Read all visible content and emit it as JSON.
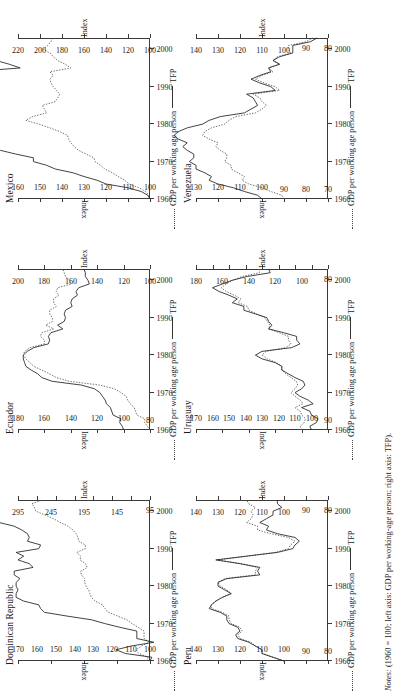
{
  "figure": {
    "notes_label": "Notes:",
    "notes_text": "(1960 = 100; left axis: GDP per working-age person; right axis: TFP).",
    "legend": {
      "gdp_label": "GDP per working age person",
      "tfp_label": "TFP"
    },
    "axis_name": "Index",
    "x_ticks": [
      "1960",
      "1970",
      "1980",
      "1990",
      "2000"
    ]
  },
  "chart_data": [
    {
      "type": "line",
      "title": "Dominican Republic",
      "xlabel": "",
      "ylabel": "Index",
      "y2label": "Index",
      "xlim": [
        1960,
        2003
      ],
      "ylim": [
        95,
        295
      ],
      "y2lim": [
        100,
        170
      ],
      "yticks": [
        95,
        145,
        195,
        245,
        295
      ],
      "y2ticks": [
        100,
        110,
        120,
        130,
        140,
        150,
        160,
        170
      ],
      "xticks": [
        1960,
        1970,
        1980,
        1990,
        2000
      ],
      "grid": false,
      "legend_position": "bottom",
      "x": [
        1960,
        1961,
        1962,
        1963,
        1964,
        1965,
        1966,
        1967,
        1968,
        1969,
        1970,
        1971,
        1972,
        1973,
        1974,
        1975,
        1976,
        1977,
        1978,
        1979,
        1980,
        1981,
        1982,
        1983,
        1984,
        1985,
        1986,
        1987,
        1988,
        1989,
        1990,
        1991,
        1992,
        1993,
        1994,
        1995,
        1996,
        1997,
        1998,
        1999,
        2000,
        2001,
        2002,
        2003
      ],
      "series": [
        {
          "name": "GDP per working age person",
          "style": "dotted",
          "axis": "left",
          "values": [
            100,
            98,
            112,
            116,
            108,
            96,
            104,
            104,
            104,
            113,
            122,
            130,
            144,
            158,
            163,
            167,
            178,
            184,
            186,
            188,
            192,
            194,
            194,
            199,
            200,
            190,
            193,
            201,
            200,
            206,
            193,
            193,
            203,
            204,
            207,
            212,
            219,
            231,
            241,
            254,
            268,
            270,
            274,
            258
          ]
        },
        {
          "name": "TFP",
          "style": "solid",
          "axis": "right",
          "values": [
            100,
            99,
            113,
            118,
            110,
            98,
            107,
            107,
            107,
            116,
            124,
            131,
            144,
            156,
            158,
            159,
            167,
            171,
            171,
            170,
            171,
            171,
            169,
            172,
            172,
            162,
            164,
            170,
            167,
            171,
            159,
            158,
            165,
            164,
            165,
            168,
            172,
            180,
            186,
            194,
            203,
            203,
            204,
            191
          ]
        }
      ]
    },
    {
      "type": "line",
      "title": "Ecuador",
      "xlabel": "",
      "ylabel": "Index",
      "y2label": "Index",
      "xlim": [
        1960,
        2003
      ],
      "ylim": [
        100,
        200
      ],
      "y2lim": [
        80,
        180
      ],
      "yticks": [
        100,
        120,
        140,
        160,
        180,
        200
      ],
      "y2ticks": [
        80,
        100,
        120,
        140,
        160,
        180
      ],
      "xticks": [
        1960,
        1970,
        1980,
        1990,
        2000
      ],
      "grid": false,
      "legend_position": "bottom",
      "x": [
        1960,
        1961,
        1962,
        1963,
        1964,
        1965,
        1966,
        1967,
        1968,
        1969,
        1970,
        1971,
        1972,
        1973,
        1974,
        1975,
        1976,
        1977,
        1978,
        1979,
        1980,
        1981,
        1982,
        1983,
        1984,
        1985,
        1986,
        1987,
        1988,
        1989,
        1990,
        1991,
        1992,
        1993,
        1994,
        1995,
        1996,
        1997,
        1998,
        1999,
        2000,
        2001,
        2002,
        2003
      ],
      "series": [
        {
          "name": "GDP per working age person",
          "style": "dotted",
          "axis": "left",
          "values": [
            100,
            102,
            104,
            104,
            110,
            111,
            112,
            115,
            117,
            118,
            122,
            127,
            138,
            161,
            171,
            176,
            182,
            188,
            191,
            194,
            196,
            195,
            191,
            180,
            180,
            183,
            182,
            173,
            179,
            174,
            174,
            176,
            176,
            171,
            173,
            173,
            169,
            171,
            170,
            160,
            161,
            164,
            165,
            166
          ]
        },
        {
          "name": "TFP",
          "style": "solid",
          "axis": "right",
          "values": [
            100,
            101,
            103,
            102,
            108,
            109,
            110,
            113,
            114,
            116,
            118,
            122,
            132,
            154,
            162,
            165,
            170,
            174,
            175,
            176,
            176,
            173,
            168,
            157,
            156,
            157,
            155,
            146,
            150,
            145,
            144,
            145,
            144,
            139,
            140,
            139,
            135,
            136,
            134,
            126,
            127,
            129,
            129,
            130
          ]
        }
      ]
    },
    {
      "type": "line",
      "title": "Mexico",
      "xlabel": "",
      "ylabel": "Index",
      "y2label": "Index",
      "xlim": [
        1960,
        2003
      ],
      "ylim": [
        100,
        220
      ],
      "y2lim": [
        100,
        160
      ],
      "yticks": [
        100,
        120,
        140,
        160,
        180,
        200,
        220
      ],
      "y2ticks": [
        100,
        110,
        120,
        130,
        140,
        150,
        160
      ],
      "xticks": [
        1960,
        1970,
        1980,
        1990,
        2000
      ],
      "grid": false,
      "legend_position": "bottom",
      "x": [
        1960,
        1961,
        1962,
        1963,
        1964,
        1965,
        1966,
        1967,
        1968,
        1969,
        1970,
        1971,
        1972,
        1973,
        1974,
        1975,
        1976,
        1977,
        1978,
        1979,
        1980,
        1981,
        1982,
        1983,
        1984,
        1985,
        1986,
        1987,
        1988,
        1989,
        1990,
        1991,
        1992,
        1993,
        1994,
        1995,
        1996,
        1997,
        1998,
        1999,
        2000,
        2001,
        2002,
        2003
      ],
      "series": [
        {
          "name": "GDP per working age person",
          "style": "dotted",
          "axis": "left",
          "values": [
            100,
            101,
            104,
            110,
            119,
            123,
            129,
            134,
            141,
            145,
            150,
            151,
            158,
            165,
            169,
            172,
            174,
            175,
            182,
            191,
            201,
            213,
            207,
            194,
            196,
            198,
            186,
            184,
            182,
            185,
            188,
            190,
            191,
            188,
            191,
            172,
            177,
            184,
            188,
            191,
            197,
            193,
            190,
            189
          ]
        },
        {
          "name": "TFP",
          "style": "solid",
          "axis": "right",
          "values": [
            100,
            101,
            104,
            110,
            120,
            124,
            130,
            135,
            143,
            147,
            153,
            153,
            161,
            168,
            172,
            173,
            176,
            176,
            183,
            193,
            204,
            218,
            210,
            194,
            196,
            197,
            183,
            180,
            177,
            180,
            182,
            183,
            183,
            178,
            181,
            159,
            164,
            170,
            173,
            174,
            180,
            174,
            171,
            169
          ]
        }
      ]
    },
    {
      "type": "line",
      "title": "Peru",
      "xlabel": "",
      "ylabel": "Index",
      "y2label": "Index",
      "xlim": [
        1960,
        2003
      ],
      "ylim": [
        80,
        140
      ],
      "y2lim": [
        80,
        140
      ],
      "yticks": [
        80,
        90,
        100,
        110,
        120,
        130,
        140
      ],
      "y2ticks": [
        80,
        90,
        100,
        110,
        120,
        130,
        140
      ],
      "xticks": [
        1960,
        1970,
        1980,
        1990,
        2000
      ],
      "grid": false,
      "legend_position": "bottom",
      "x": [
        1960,
        1961,
        1962,
        1963,
        1964,
        1965,
        1966,
        1967,
        1968,
        1969,
        1970,
        1971,
        1972,
        1973,
        1974,
        1975,
        1976,
        1977,
        1978,
        1979,
        1980,
        1981,
        1982,
        1983,
        1984,
        1985,
        1986,
        1987,
        1988,
        1989,
        1990,
        1991,
        1992,
        1993,
        1994,
        1995,
        1996,
        1997,
        1998,
        1999,
        2000,
        2001,
        2002,
        2003
      ],
      "series": [
        {
          "name": "GDP per working age person",
          "style": "dotted",
          "axis": "left",
          "values": [
            100,
            105,
            110,
            110,
            113,
            115,
            120,
            121,
            119,
            120,
            124,
            125,
            125,
            128,
            133,
            133,
            131,
            128,
            124,
            126,
            129,
            130,
            127,
            113,
            113,
            112,
            120,
            130,
            117,
            104,
            98,
            97,
            95,
            98,
            106,
            112,
            112,
            117,
            115,
            114,
            115,
            113,
            116,
            117
          ]
        },
        {
          "name": "TFP",
          "style": "solid",
          "axis": "right",
          "values": [
            100,
            105,
            110,
            110,
            113,
            116,
            121,
            122,
            120,
            121,
            125,
            126,
            126,
            129,
            134,
            133,
            131,
            128,
            124,
            127,
            130,
            130,
            126,
            111,
            112,
            111,
            120,
            131,
            117,
            103,
            96,
            95,
            93,
            95,
            103,
            108,
            107,
            111,
            108,
            105,
            105,
            101,
            103,
            103
          ]
        }
      ]
    },
    {
      "type": "line",
      "title": "Uruguay",
      "xlabel": "",
      "ylabel": "Index",
      "y2label": "Index",
      "xlim": [
        1960,
        2003
      ],
      "ylim": [
        80,
        180
      ],
      "y2lim": [
        90,
        170
      ],
      "yticks": [
        80,
        100,
        120,
        140,
        160,
        180
      ],
      "y2ticks": [
        90,
        100,
        110,
        120,
        130,
        140,
        150,
        160,
        170
      ],
      "xticks": [
        1960,
        1970,
        1980,
        1990,
        2000
      ],
      "grid": false,
      "legend_position": "bottom",
      "x": [
        1960,
        1961,
        1962,
        1963,
        1964,
        1965,
        1966,
        1967,
        1968,
        1969,
        1970,
        1971,
        1972,
        1973,
        1974,
        1975,
        1976,
        1977,
        1978,
        1979,
        1980,
        1981,
        1982,
        1983,
        1984,
        1985,
        1986,
        1987,
        1988,
        1989,
        1990,
        1991,
        1992,
        1993,
        1994,
        1995,
        1996,
        1997,
        1998,
        1999,
        2000,
        2001,
        2002,
        2003
      ],
      "series": [
        {
          "name": "GDP per working age person",
          "style": "dotted",
          "axis": "left",
          "values": [
            100,
            101,
            98,
            97,
            100,
            101,
            105,
            99,
            101,
            105,
            108,
            105,
            103,
            104,
            108,
            112,
            115,
            115,
            119,
            126,
            130,
            127,
            112,
            108,
            110,
            110,
            117,
            125,
            124,
            126,
            128,
            134,
            140,
            141,
            148,
            146,
            151,
            157,
            161,
            157,
            152,
            145,
            132,
            132
          ]
        },
        {
          "name": "TFP",
          "style": "solid",
          "axis": "right",
          "values": [
            100,
            101,
            97,
            96,
            100,
            101,
            106,
            99,
            102,
            107,
            110,
            106,
            104,
            105,
            110,
            114,
            118,
            118,
            122,
            130,
            134,
            130,
            112,
            107,
            109,
            109,
            117,
            126,
            124,
            126,
            127,
            134,
            141,
            141,
            148,
            145,
            150,
            156,
            160,
            154,
            148,
            139,
            125,
            126
          ]
        }
      ]
    },
    {
      "type": "line",
      "title": "Venezuela",
      "xlabel": "",
      "ylabel": "Index",
      "y2label": "Index",
      "xlim": [
        1960,
        2003
      ],
      "ylim": [
        80,
        140
      ],
      "y2lim": [
        70,
        130
      ],
      "yticks": [
        80,
        90,
        100,
        110,
        120,
        130,
        140
      ],
      "y2ticks": [
        70,
        80,
        90,
        100,
        110,
        120,
        130
      ],
      "xticks": [
        1960,
        1970,
        1980,
        1990,
        2000
      ],
      "grid": false,
      "legend_position": "bottom",
      "x": [
        1960,
        1961,
        1962,
        1963,
        1964,
        1965,
        1966,
        1967,
        1968,
        1969,
        1970,
        1971,
        1972,
        1973,
        1974,
        1975,
        1976,
        1977,
        1978,
        1979,
        1980,
        1981,
        1982,
        1983,
        1984,
        1985,
        1986,
        1987,
        1988,
        1989,
        1990,
        1991,
        1992,
        1993,
        1994,
        1995,
        1996,
        1997,
        1998,
        1999,
        2000,
        2001,
        2002,
        2003
      ],
      "series": [
        {
          "name": "GDP per working age person",
          "style": "dotted",
          "axis": "left",
          "values": [
            100,
            101,
            106,
            110,
            116,
            119,
            118,
            121,
            124,
            124,
            127,
            126,
            126,
            129,
            131,
            130,
            134,
            137,
            136,
            133,
            127,
            125,
            122,
            113,
            110,
            108,
            110,
            111,
            114,
            102,
            104,
            109,
            113,
            110,
            105,
            107,
            102,
            105,
            103,
            97,
            98,
            98,
            90,
            87
          ]
        },
        {
          "name": "TFP",
          "style": "solid",
          "axis": "right",
          "values": [
            100,
            102,
            108,
            113,
            120,
            124,
            123,
            126,
            130,
            130,
            133,
            131,
            131,
            134,
            136,
            134,
            138,
            140,
            138,
            134,
            127,
            124,
            119,
            108,
            105,
            102,
            103,
            104,
            107,
            94,
            96,
            101,
            105,
            101,
            96,
            97,
            92,
            95,
            92,
            86,
            86,
            86,
            78,
            75
          ]
        }
      ]
    }
  ]
}
